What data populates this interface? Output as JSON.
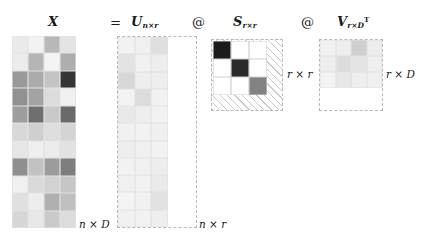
{
  "figure": {
    "type": "matrix-factorization-diagram",
    "equation_plain": "X = U_{n x r} @ S_{r x r} @ V_{r x D}^T",
    "background_color": "#ffffff"
  },
  "labels": {
    "x_symbol": "X",
    "equals": "=",
    "u_symbol": "U",
    "u_subscript": "n×r",
    "at_1": "@",
    "s_symbol": "S",
    "s_subscript": "r×r",
    "at_2": "@",
    "v_symbol": "V",
    "v_subscript": "r×D",
    "v_superscript": "T"
  },
  "dimension_labels": {
    "x_dims": "n × D",
    "u_dims": "n × r",
    "s_dims": "r × r",
    "v_dims": "r × D"
  },
  "colors": {
    "text": "#1a1a1a",
    "dashed_border": "#b9b9b9",
    "grid_line": "#e2e2e2",
    "hatch_line": "#c9c9c9",
    "s_black": "#1c1c1c",
    "s_dark": "#2a2a2a",
    "s_gray": "#828282",
    "s_white": "#ffffff"
  },
  "chart_data": {
    "type": "heatmap",
    "title": "",
    "xlabel": "",
    "ylabel": "",
    "matrices": [
      {
        "name": "X",
        "rows": 11,
        "cols": 4,
        "note": "observed data matrix, n x D",
        "cells": [
          [
            "#eaeaea",
            "#f2f2f2",
            "#b8b8b8",
            "#e4e4e4"
          ],
          [
            "#ececec",
            "#b5b5b5",
            "#f4f4f4",
            "#aeaeae"
          ],
          [
            "#9a9a9a",
            "#ababab",
            "#c4c4c4",
            "#343434"
          ],
          [
            "#919191",
            "#a3a3a3",
            "#dcdcdc",
            "#f0f0f0"
          ],
          [
            "#9d9d9d",
            "#6f6f6f",
            "#c9c9c9",
            "#6a6a6a"
          ],
          [
            "#d8d8d8",
            "#cfcfcf",
            "#dedede",
            "#d4d4d4"
          ],
          [
            "#e6e6e6",
            "#efefef",
            "#ebebeb",
            "#e2e2e2"
          ],
          [
            "#8f8f8f",
            "#c2c2c2",
            "#9c9c9c",
            "#7e7e7e"
          ],
          [
            "#f0f0f0",
            "#dadada",
            "#d2d2d2",
            "#c6c6c6"
          ],
          [
            "#e0e0e0",
            "#ededed",
            "#b0b0b0",
            "#c0c0c0"
          ],
          [
            "#d6d6d6",
            "#e8e8e8",
            "#cacaca",
            "#dcdcdc"
          ]
        ]
      },
      {
        "name": "U",
        "rows": 11,
        "cols": 3,
        "note": "left factor, n x r; dashed outline shows full n x D extent",
        "cells": [
          [
            "#f2f2f2",
            "#f0f0f0",
            "#dfdfdf"
          ],
          [
            "#e3e3e3",
            "#f1f1f1",
            "#ededed"
          ],
          [
            "#d7d7d7",
            "#eeeeee",
            "#eeeeee"
          ],
          [
            "#f3f3f3",
            "#dcdcdc",
            "#f1f1f1"
          ],
          [
            "#e9e9e9",
            "#eeeeee",
            "#f2f2f2"
          ],
          [
            "#f1f1f1",
            "#f2f2f2",
            "#efefef"
          ],
          [
            "#eeeeee",
            "#f0f0f0",
            "#f2f2f2"
          ],
          [
            "#f2f2f2",
            "#f1f1f1",
            "#ededed"
          ],
          [
            "#f0f0f0",
            "#f2f2f2",
            "#eaeaea"
          ],
          [
            "#f4f4f4",
            "#f1f1f1",
            "#e1e1e1"
          ],
          [
            "#f1f1f1",
            "#f2f2f2",
            "#eeeeee"
          ]
        ]
      },
      {
        "name": "S",
        "rows": 3,
        "cols": 3,
        "note": "diagonal singular-value matrix, r x r, hatched background",
        "cells": [
          [
            "#1c1c1c",
            "#ffffff",
            "#ffffff"
          ],
          [
            "#ffffff",
            "#2a2a2a",
            "#ffffff"
          ],
          [
            "#ffffff",
            "#ffffff",
            "#828282"
          ]
        ]
      },
      {
        "name": "V",
        "rows": 3,
        "cols": 4,
        "note": "right factor transposed, r x D; dashed outline shows full D x D extent",
        "cells": [
          [
            "#f1f1f1",
            "#eeeeee",
            "#cfcfcf",
            "#ececec"
          ],
          [
            "#eeeeee",
            "#dcdcdc",
            "#e4e4e4",
            "#efefef"
          ],
          [
            "#f2f2f2",
            "#e8e8e8",
            "#eeeeee",
            "#f0f0f0"
          ]
        ]
      }
    ]
  }
}
